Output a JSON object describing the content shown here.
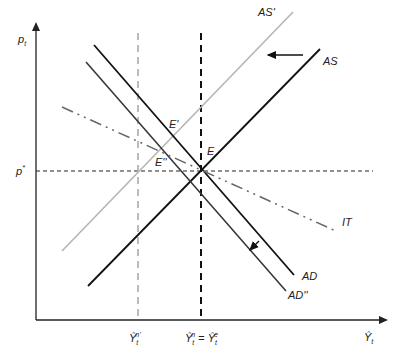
{
  "diagram": {
    "type": "AD-AS / inflation targeting diagram",
    "axes": {
      "y_label": "p",
      "y_label_sub": "t",
      "x_label": "Ŷ",
      "x_label_sub": "t"
    },
    "reference": {
      "p_star": "p",
      "p_star_sup": "*",
      "y_low": "Ŷ",
      "y_low_sup": "n'",
      "y_low_sub": "t",
      "y_natural": "Ŷ",
      "y_natural_sup": "n",
      "y_natural_sub": "t",
      "equals": "=",
      "y_expected": "Ŷ",
      "y_expected_sup": "e",
      "y_expected_sub": "t"
    },
    "curves": {
      "as": "AS",
      "as_prime": "AS'",
      "ad": "AD",
      "ad_double_prime": "AD''",
      "it": "IT"
    },
    "points": {
      "e": "E",
      "e_prime": "E'",
      "e_double_prime": "E''"
    },
    "colors": {
      "ink": "#111111",
      "gray_curve": "#b5b5b5",
      "ad_shifted": "#333333",
      "it_line": "#666666",
      "dashed_gray": "#aaaaaa"
    }
  }
}
